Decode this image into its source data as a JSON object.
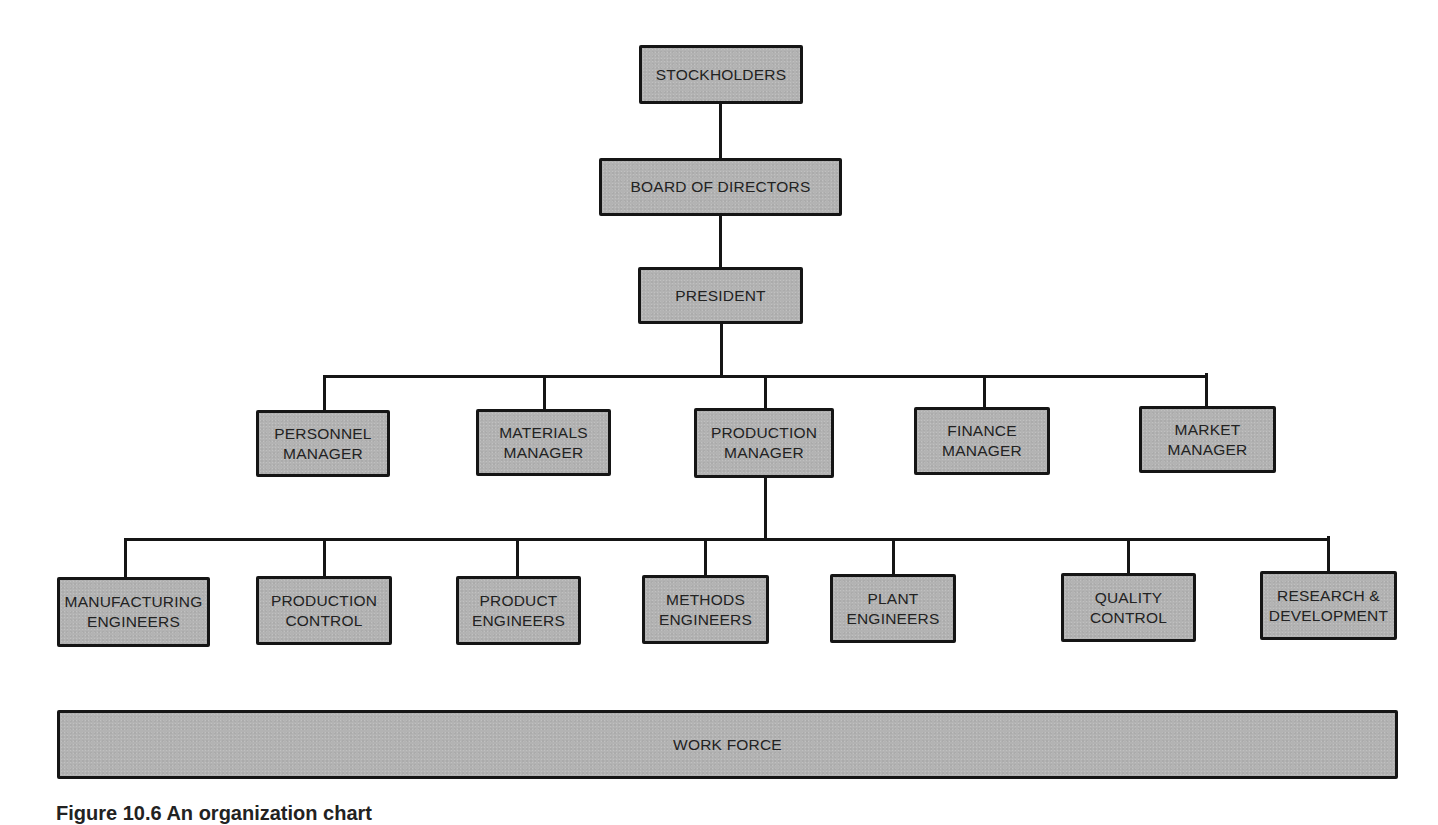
{
  "diagram": {
    "type": "organization-chart",
    "caption": "Figure 10.6   An organization chart",
    "colors": {
      "box_fill": "#b3b3b3",
      "box_border": "#151515",
      "connector": "#151515",
      "background": "#ffffff"
    },
    "levels": {
      "stockholders": {
        "label": "STOCKHOLDERS"
      },
      "board": {
        "label": "BOARD OF DIRECTORS"
      },
      "president": {
        "label": "PRESIDENT"
      },
      "managers": [
        {
          "label": "PERSONNEL\nMANAGER"
        },
        {
          "label": "MATERIALS\nMANAGER"
        },
        {
          "label": "PRODUCTION\nMANAGER"
        },
        {
          "label": "FINANCE\nMANAGER"
        },
        {
          "label": "MARKET\nMANAGER"
        }
      ],
      "production_departments": [
        {
          "label": "MANUFACTURING\nENGINEERS"
        },
        {
          "label": "PRODUCTION\nCONTROL"
        },
        {
          "label": "PRODUCT\nENGINEERS"
        },
        {
          "label": "METHODS\nENGINEERS"
        },
        {
          "label": "PLANT\nENGINEERS"
        },
        {
          "label": "QUALITY\nCONTROL"
        },
        {
          "label": "RESEARCH &\nDEVELOPMENT"
        }
      ],
      "work_force": {
        "label": "WORK FORCE"
      }
    },
    "hierarchy": [
      {
        "from": "STOCKHOLDERS",
        "to": "BOARD OF DIRECTORS"
      },
      {
        "from": "BOARD OF DIRECTORS",
        "to": "PRESIDENT"
      },
      {
        "from": "PRESIDENT",
        "to": [
          "PERSONNEL MANAGER",
          "MATERIALS MANAGER",
          "PRODUCTION MANAGER",
          "FINANCE MANAGER",
          "MARKET MANAGER"
        ]
      },
      {
        "from": "PRODUCTION MANAGER",
        "to": [
          "MANUFACTURING ENGINEERS",
          "PRODUCTION CONTROL",
          "PRODUCT ENGINEERS",
          "METHODS ENGINEERS",
          "PLANT ENGINEERS",
          "QUALITY CONTROL",
          "RESEARCH & DEVELOPMENT"
        ]
      }
    ]
  }
}
